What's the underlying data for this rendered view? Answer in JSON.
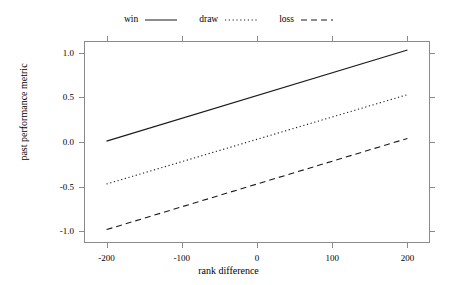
{
  "chart_data": {
    "type": "line",
    "title": "",
    "xlabel": "rank difference",
    "ylabel": "past performance metric",
    "xlim": [
      -230,
      230
    ],
    "ylim": [
      -1.13,
      1.13
    ],
    "xticks": [
      -200,
      -100,
      0,
      100,
      200
    ],
    "xticklabels": [
      "-200",
      "-100",
      "0",
      "100",
      "200"
    ],
    "yticks": [
      -1.0,
      -0.5,
      0.0,
      0.5,
      1.0
    ],
    "yticklabels": [
      "-1.0",
      "-0.5",
      "0.0",
      "0.5",
      "1.0"
    ],
    "grid": false,
    "legend_position": "top-center",
    "x": [
      -200,
      200
    ],
    "series": [
      {
        "name": "win",
        "linestyle": "solid",
        "color": "#1a1a1a",
        "values": [
          0.01,
          1.03
        ]
      },
      {
        "name": "draw",
        "linestyle": "dotted",
        "color": "#1a1a1a",
        "values": [
          -0.47,
          0.53
        ]
      },
      {
        "name": "loss",
        "linestyle": "dashed",
        "color": "#1a1a1a",
        "values": [
          -0.98,
          0.04
        ]
      }
    ]
  },
  "legend": {
    "entries": [
      {
        "label": "win"
      },
      {
        "label": "draw"
      },
      {
        "label": "loss"
      }
    ]
  },
  "axes": {
    "x_title": "rank difference",
    "y_title": "past performance metric",
    "x_tick_labels": [
      "-200",
      "-100",
      "0",
      "100",
      "200"
    ],
    "y_tick_labels": [
      "1.0",
      "0.5",
      "0.0",
      "-0.5",
      "-1.0"
    ]
  },
  "style": {
    "frame_color": "#8a8a8a",
    "line_color": "#1a1a1a",
    "background": "#ffffff"
  }
}
